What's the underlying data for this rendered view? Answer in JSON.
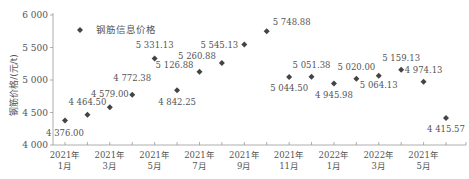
{
  "chart_data": {
    "type": "scatter",
    "title": "",
    "xlabel": "",
    "ylabel": "钢筋价格/(元/t)",
    "ylim": [
      4000,
      6000
    ],
    "yticks": [
      4000,
      4500,
      5000,
      5500,
      6000
    ],
    "ytick_labels": [
      "4 000",
      "4 500",
      "5 000",
      "5 500",
      "6 000"
    ],
    "grid": false,
    "legend": {
      "position": "upper-left",
      "entries": [
        "钢筋信息价格"
      ]
    },
    "marker": "diamond",
    "marker_color": "#444444",
    "x_tick_labels": [
      {
        "year": "2021年",
        "month": "1月"
      },
      {
        "year": "2021年",
        "month": "3月"
      },
      {
        "year": "2021年",
        "month": "5月"
      },
      {
        "year": "2021年",
        "month": "7月"
      },
      {
        "year": "2021年",
        "month": "9月"
      },
      {
        "year": "2021年",
        "month": "11月"
      },
      {
        "year": "2022年",
        "month": "1月"
      },
      {
        "year": "2022年",
        "month": "3月"
      },
      {
        "year": "2021年",
        "month": "5月"
      }
    ],
    "series": [
      {
        "name": "钢筋信息价格",
        "values": [
          4376.0,
          4464.5,
          4579.0,
          4772.38,
          5331.13,
          4842.25,
          5126.88,
          5260.88,
          5545.13,
          5748.88,
          5044.5,
          5051.38,
          4945.98,
          5020.0,
          5064.13,
          5159.13,
          4974.13,
          4415.57
        ],
        "labels": [
          "4 376.00",
          "4 464.50",
          "4 579.00",
          "4 772.38",
          "5 331.13",
          "4 842.25",
          "5 126.88",
          "5 260.88",
          "5 545.13",
          "5 748.88",
          "5 044.50",
          "5 051.38",
          "4 945.98",
          "5 020.00",
          "5 064.13",
          "5 159.13",
          "4 974.13",
          "4 415.57"
        ]
      }
    ]
  }
}
